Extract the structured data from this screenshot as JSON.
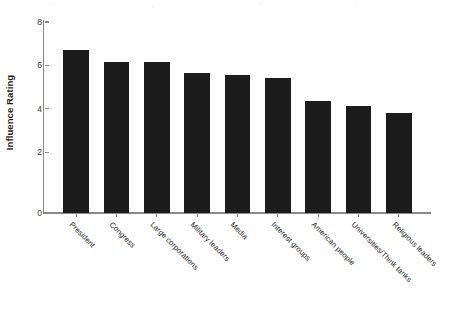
{
  "chart_data": {
    "type": "bar",
    "title": "",
    "xlabel": "",
    "ylabel": "Influence Rating",
    "categories": [
      "President",
      "Congress",
      "Large corporations",
      "Military leaders",
      "Media",
      "Interest groups",
      "American people",
      "Universities/Think tanks",
      "Religious leaders"
    ],
    "values": [
      7.5,
      6.95,
      6.95,
      6.45,
      6.35,
      6.2,
      5.15,
      4.95,
      4.6
    ],
    "ylim": [
      0,
      8.8
    ],
    "yticks": [
      0,
      2,
      4,
      6,
      8
    ],
    "ytick_labels": [
      "0",
      "2",
      "4",
      "6",
      "8"
    ],
    "grid": false,
    "legend": null,
    "bar_color": "#1c1c1c",
    "axis_color": "#8a8a8a",
    "background_color": "#ffffff"
  },
  "axis": {
    "y_title": "Influence Rating",
    "tick_0": "0",
    "tick_1": "2",
    "tick_2": "4",
    "tick_3": "6",
    "tick_4": "8"
  }
}
